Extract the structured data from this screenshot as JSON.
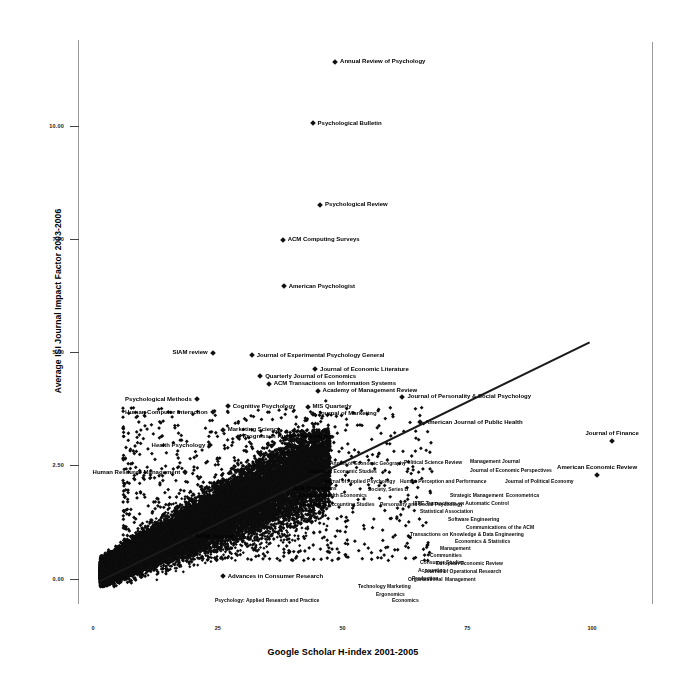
{
  "chart_data": {
    "type": "scatter",
    "title": "",
    "xlabel": "Google Scholar H-index 2001-2005",
    "ylabel": "Average ISI Journal Impact Factor 2003-2006",
    "xlim": [
      -3,
      112
    ],
    "ylim": [
      -0.55,
      11.9
    ],
    "xticks": [
      "0",
      "25",
      "50",
      "75",
      "100"
    ],
    "xtick_values": [
      0,
      25,
      50,
      75,
      100
    ],
    "yticks": [
      "0.00",
      "2.50",
      "5.00",
      "7.50",
      "10.00"
    ],
    "ytick_values": [
      0.0,
      2.5,
      5.0,
      7.5,
      10.0
    ],
    "grid": false,
    "legend": "none",
    "marker": "diamond",
    "trendline": {
      "type": "linear",
      "x0": 1.5,
      "y0": -0.05,
      "x1": 99.5,
      "y1": 5.22
    },
    "labeled_points": [
      {
        "label": "Annual Review of Psychology",
        "x": 48.5,
        "y": 11.42,
        "lx": 1
      },
      {
        "label": "Psychological Bulletin",
        "x": 44.0,
        "y": 10.06,
        "lx": 1
      },
      {
        "label": "Psychological Review",
        "x": 45.5,
        "y": 8.26,
        "lx": 1
      },
      {
        "label": "ACM Computing Surveys",
        "x": 38.0,
        "y": 7.49,
        "lx": 1
      },
      {
        "label": "American Psychologist",
        "x": 38.2,
        "y": 6.46,
        "lx": 1
      },
      {
        "label": "SIAM review",
        "x": 24.0,
        "y": 4.99,
        "lx": 0
      },
      {
        "label": "Journal of Experimental Psychology General",
        "x": 31.8,
        "y": 4.94,
        "lx": 1
      },
      {
        "label": "Journal of Economic Literature",
        "x": 44.5,
        "y": 4.63,
        "lx": 1
      },
      {
        "label": "Quarterly Journal of Economics",
        "x": 33.5,
        "y": 4.47,
        "lx": 1
      },
      {
        "label": "ACM Transactions on Information Systems",
        "x": 35.2,
        "y": 4.3,
        "lx": 1
      },
      {
        "label": "Academy of Management Review",
        "x": 45.0,
        "y": 4.15,
        "lx": 1
      },
      {
        "label": "Psychological Methods",
        "x": 20.8,
        "y": 3.96,
        "lx": 0
      },
      {
        "label": "Journal of Personality & Social Psychology",
        "x": 62.0,
        "y": 4.02,
        "lx": 1
      },
      {
        "label": "Cognitive Psychology",
        "x": 27.0,
        "y": 3.81,
        "lx": 1
      },
      {
        "label": "MIS Quarterly",
        "x": 43.0,
        "y": 3.8,
        "lx": 1
      },
      {
        "label": "Human Computer Interaction",
        "x": 24.0,
        "y": 3.67,
        "lx": 0
      },
      {
        "label": "Journal of Marketing",
        "x": 44.0,
        "y": 3.64,
        "lx": 1
      },
      {
        "label": "American Journal of Public Health",
        "x": 65.5,
        "y": 3.46,
        "lx": 1
      },
      {
        "label": "Marketing Science",
        "x": 26.0,
        "y": 3.29,
        "lx": 1
      },
      {
        "label": "Progress in Human Geography",
        "x": 29.0,
        "y": 3.13,
        "lx": 1
      },
      {
        "label": "Health Psychology",
        "x": 23.5,
        "y": 2.95,
        "lx": 0
      },
      {
        "label": "Journal of Finance",
        "x": 104.0,
        "y": 3.05,
        "lx": 0,
        "above": 1
      },
      {
        "label": "Human Resource Management",
        "x": 18.5,
        "y": 2.35,
        "lx": 0
      },
      {
        "label": "American Economic Review",
        "x": 101.0,
        "y": 2.28,
        "lx": 0,
        "above": 1
      },
      {
        "label": "SIAM Journal",
        "x": 19.5,
        "y": 0.92,
        "lx": 1
      },
      {
        "label": "Advances in Consumer Research",
        "x": 26.0,
        "y": 0.05,
        "lx": 1
      }
    ],
    "cluster_labels": [
      {
        "text": "Annals of Economic Geography",
        "x": 330,
        "y": 460
      },
      {
        "text": "Political Science Review",
        "x": 404,
        "y": 459
      },
      {
        "text": "Management Journal",
        "x": 470,
        "y": 458
      },
      {
        "text": "Journal of Economic Perspectives",
        "x": 470,
        "y": 467
      },
      {
        "text": "Journal of Economic Studies",
        "x": 308,
        "y": 468
      },
      {
        "text": "Journal of Applied Psychology",
        "x": 322,
        "y": 478
      },
      {
        "text": "Human Perception and Performance",
        "x": 400,
        "y": 478
      },
      {
        "text": "Journal of Political Economy",
        "x": 505,
        "y": 478
      },
      {
        "text": "Society, Series B",
        "x": 368,
        "y": 486
      },
      {
        "text": "Journal of Health Economics",
        "x": 298,
        "y": 492
      },
      {
        "text": "Strategic Management",
        "x": 450,
        "y": 492
      },
      {
        "text": "Econometrica",
        "x": 506,
        "y": 492
      },
      {
        "text": "ACM Transactions",
        "x": 293,
        "y": 485
      },
      {
        "text": "Review of Accounting Studies",
        "x": 303,
        "y": 501
      },
      {
        "text": "Personality and Social Psychology",
        "x": 380,
        "y": 501
      },
      {
        "text": "IEEE Transactions on Automatic Control",
        "x": 413,
        "y": 500
      },
      {
        "text": "Statistical Association",
        "x": 420,
        "y": 508
      },
      {
        "text": "Software Engineering",
        "x": 448,
        "y": 516
      },
      {
        "text": "Communications of the ACM",
        "x": 466,
        "y": 524
      },
      {
        "text": "Transactions on Knowledge & Data Engineering",
        "x": 410,
        "y": 531
      },
      {
        "text": "Economics & Statistics",
        "x": 455,
        "y": 538
      },
      {
        "text": "Management",
        "x": 440,
        "y": 545
      },
      {
        "text": "Communities",
        "x": 430,
        "y": 552
      },
      {
        "text": "Consumer Studies",
        "x": 420,
        "y": 559
      },
      {
        "text": "European Economic Review",
        "x": 436,
        "y": 560
      },
      {
        "text": "Accounting",
        "x": 418,
        "y": 567
      },
      {
        "text": "Journal of Operational Research",
        "x": 424,
        "y": 568
      },
      {
        "text": "Production",
        "x": 412,
        "y": 575
      },
      {
        "text": "Organizational",
        "x": 408,
        "y": 576
      },
      {
        "text": "Management",
        "x": 445,
        "y": 576
      },
      {
        "text": "Technology Marketing",
        "x": 358,
        "y": 583
      },
      {
        "text": "Ergonomics",
        "x": 376,
        "y": 591
      },
      {
        "text": "Psychology: Applied Research and Practice",
        "x": 215,
        "y": 597
      },
      {
        "text": "Economics",
        "x": 392,
        "y": 597
      }
    ]
  }
}
